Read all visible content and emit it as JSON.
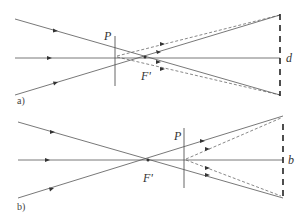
{
  "panels": [
    {
      "id": "a",
      "caption": "a)",
      "lens_label": "P",
      "focus_label": "F'",
      "screen_label": "d"
    },
    {
      "id": "b",
      "caption": "b)",
      "lens_label": "P",
      "focus_label": "F'",
      "screen_label": "b"
    }
  ],
  "colors": {
    "ray": "#555555",
    "screen": "#222222",
    "text": "#333333"
  }
}
